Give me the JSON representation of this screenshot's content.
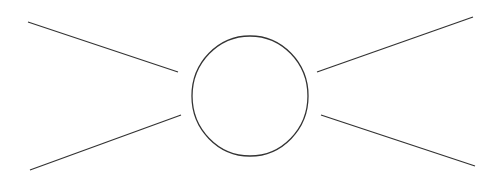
{
  "diagram": {
    "background": "#ffffff",
    "stroke_color": "#333333",
    "stroke_width": 1.3,
    "circle": {
      "cx": 250,
      "cy": 96,
      "rx": 58,
      "ry": 60
    },
    "lines": [
      {
        "name": "line-top-left",
        "x1": 28,
        "y1": 22,
        "x2": 178,
        "y2": 72
      },
      {
        "name": "line-bottom-left",
        "x1": 30,
        "y1": 170,
        "x2": 181,
        "y2": 115
      },
      {
        "name": "line-top-right",
        "x1": 317,
        "y1": 72,
        "x2": 473,
        "y2": 17
      },
      {
        "name": "line-bottom-right",
        "x1": 321,
        "y1": 115,
        "x2": 475,
        "y2": 166
      }
    ]
  }
}
